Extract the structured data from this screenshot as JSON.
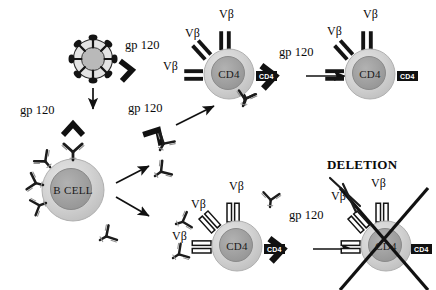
{
  "figure": {
    "type": "biological-schematic",
    "background": "#ffffff",
    "ink": "#111111"
  },
  "palette": {
    "ink": "#111111",
    "cell_outer": "#d9d9d9",
    "cell_mid": "#bdbdbd",
    "cell_core": "#9e9e9e",
    "antibody_fill": "#c9c9c9",
    "antibody_stroke": "#1a1a1a",
    "receptor_solid": "#141414",
    "receptor_hollow_fill": "#ffffff",
    "badge_bg": "#111111",
    "badge_text": "#ffffff"
  },
  "labels": {
    "gp120": "gp 120",
    "vbeta": "Vβ",
    "deletion": "DELETION",
    "bcell": "B CELL",
    "cd4": "CD4",
    "cd4_badge": "CD4"
  },
  "cells": [
    {
      "id": "virus",
      "name": "hiv-virion",
      "cx": 93,
      "cy": 59,
      "r": 21
    },
    {
      "id": "bcell",
      "name": "b-cell",
      "cx": 73,
      "cy": 190,
      "r": 31,
      "label": "B CELL"
    },
    {
      "id": "cd4_top_mid",
      "name": "cd4-t-cell-top-mid",
      "cx": 229,
      "cy": 74,
      "r": 25,
      "label": "CD4"
    },
    {
      "id": "cd4_top_right",
      "name": "cd4-t-cell-top-right",
      "cx": 370,
      "cy": 74,
      "r": 25,
      "label": "CD4"
    },
    {
      "id": "cd4_bot_mid",
      "name": "cd4-t-cell-bottom-mid",
      "cx": 237,
      "cy": 246,
      "r": 25,
      "label": "CD4"
    },
    {
      "id": "cd4_deleted",
      "name": "cd4-t-cell-deleted",
      "cx": 386,
      "cy": 246,
      "r": 25,
      "label": "CD4"
    }
  ],
  "gp120_labels": [
    {
      "id": "gp1",
      "text": "gp 120",
      "x": 125,
      "y": 45
    },
    {
      "id": "gp2",
      "text": "gp 120",
      "x": 20,
      "y": 110
    },
    {
      "id": "gp3",
      "text": "gp 120",
      "x": 128,
      "y": 108
    },
    {
      "id": "gp4",
      "text": "gp 120",
      "x": 279,
      "y": 52
    },
    {
      "id": "gp5",
      "text": "gp 120",
      "x": 289,
      "y": 215
    }
  ],
  "vbeta_labels": [
    {
      "id": "vb1",
      "text": "Vβ",
      "x": 219,
      "y": 14
    },
    {
      "id": "vb2",
      "text": "Vβ",
      "x": 185,
      "y": 33
    },
    {
      "id": "vb3",
      "text": "Vβ",
      "x": 163,
      "y": 66
    },
    {
      "id": "vb4",
      "text": "Vβ",
      "x": 363,
      "y": 14
    },
    {
      "id": "vb5",
      "text": "Vβ",
      "x": 327,
      "y": 31
    },
    {
      "id": "vb6",
      "text": "Vβ",
      "x": 229,
      "y": 185
    },
    {
      "id": "vb7",
      "text": "Vβ",
      "x": 191,
      "y": 203
    },
    {
      "id": "vb8",
      "text": "Vβ",
      "x": 172,
      "y": 235
    },
    {
      "id": "vb9",
      "text": "Vβ",
      "x": 371,
      "y": 182
    },
    {
      "id": "vb10",
      "text": "Vβ",
      "x": 331,
      "y": 195
    }
  ],
  "deletion_label": {
    "text": "DELETION",
    "x": 327,
    "y": 163
  },
  "flow": {
    "description": "HIV gp120 binds B cell producing anti-gp120 antibodies; antibodies cross-react with V-beta receptors on CD4 T cells; gp120 binding leads to deletion of the CD4 T cell.",
    "arrows": [
      {
        "name": "arrow-virus-to-bcell",
        "x1": 93,
        "y1": 88,
        "x2": 93,
        "y2": 108
      },
      {
        "name": "arrow-bcell-to-antibodies-up",
        "x1": 118,
        "y1": 181,
        "x2": 148,
        "y2": 165
      },
      {
        "name": "arrow-bcell-to-antibodies-down",
        "x1": 118,
        "y1": 196,
        "x2": 148,
        "y2": 214
      },
      {
        "name": "arrow-to-cd4-top",
        "x1": 175,
        "y1": 124,
        "x2": 213,
        "y2": 106
      },
      {
        "name": "arrow-cd4top-to-cd4topright",
        "x1": 307,
        "y1": 76,
        "x2": 345,
        "y2": 76
      },
      {
        "name": "arrow-cd4bot-to-deletion",
        "x1": 314,
        "y1": 249,
        "x2": 352,
        "y2": 249
      }
    ]
  }
}
